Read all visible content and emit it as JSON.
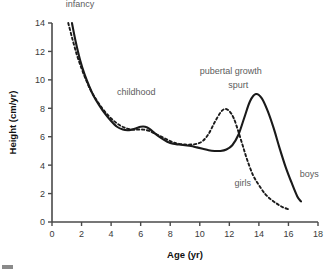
{
  "chart_data": {
    "type": "line",
    "title": "",
    "xlabel": "Age (yr)",
    "ylabel": "Height (cm/yr)",
    "xlim": [
      0,
      18
    ],
    "ylim": [
      0,
      14
    ],
    "xticks": [
      0,
      2,
      4,
      6,
      8,
      10,
      12,
      14,
      16,
      18
    ],
    "yticks": [
      0,
      2,
      4,
      6,
      8,
      10,
      12,
      14
    ],
    "grid": false,
    "legend": "inline-annotations",
    "series": [
      {
        "name": "boys",
        "style": "solid",
        "color": "#1a1a1a",
        "x": [
          1.35,
          1.6,
          1.9,
          2.2,
          2.5,
          2.8,
          3.2,
          3.6,
          4.0,
          4.4,
          4.8,
          5.1,
          5.4,
          5.7,
          6.0,
          6.3,
          6.6,
          7.0,
          7.4,
          7.8,
          8.2,
          8.6,
          9.0,
          9.4,
          9.8,
          10.2,
          10.6,
          11.0,
          11.4,
          11.8,
          12.2,
          12.6,
          13.0,
          13.4,
          13.8,
          14.2,
          14.6,
          15.0,
          15.4,
          15.8,
          16.2,
          16.6,
          16.85
        ],
        "y": [
          14.0,
          12.7,
          11.4,
          10.4,
          9.6,
          8.9,
          8.2,
          7.6,
          7.1,
          6.7,
          6.5,
          6.45,
          6.5,
          6.6,
          6.7,
          6.7,
          6.55,
          6.2,
          5.9,
          5.65,
          5.5,
          5.45,
          5.4,
          5.35,
          5.25,
          5.15,
          5.05,
          5.0,
          5.0,
          5.1,
          5.4,
          6.1,
          7.3,
          8.5,
          9.0,
          8.7,
          7.8,
          6.6,
          5.2,
          3.9,
          2.8,
          1.8,
          1.45
        ]
      },
      {
        "name": "girls",
        "style": "dashed",
        "color": "#1a1a1a",
        "x": [
          1.1,
          1.4,
          1.7,
          2.0,
          2.3,
          2.6,
          3.0,
          3.4,
          3.8,
          4.2,
          4.6,
          5.0,
          5.4,
          5.8,
          6.2,
          6.6,
          7.0,
          7.4,
          7.8,
          8.2,
          8.6,
          9.0,
          9.4,
          9.8,
          10.2,
          10.6,
          11.0,
          11.4,
          11.7,
          12.0,
          12.3,
          12.6,
          12.9,
          13.2,
          13.6,
          14.0,
          14.4,
          14.8,
          15.2,
          15.6,
          16.0
        ],
        "y": [
          14.0,
          12.8,
          11.7,
          10.8,
          10.0,
          9.3,
          8.6,
          8.0,
          7.5,
          7.1,
          6.8,
          6.6,
          6.5,
          6.5,
          6.5,
          6.4,
          6.2,
          6.0,
          5.8,
          5.6,
          5.5,
          5.45,
          5.45,
          5.5,
          5.7,
          6.2,
          7.0,
          7.7,
          7.95,
          7.8,
          7.3,
          6.4,
          5.4,
          4.4,
          3.3,
          2.6,
          2.0,
          1.6,
          1.3,
          1.05,
          0.9
        ]
      }
    ],
    "annotations": [
      {
        "text": "infancy",
        "x": 1.9,
        "y": 15.1
      },
      {
        "text": "childhood",
        "x": 5.7,
        "y": 8.9
      },
      {
        "text": "pubertal growth",
        "x": 12.1,
        "y": 10.4
      },
      {
        "text": "spurt",
        "x": 12.6,
        "y": 9.45
      },
      {
        "text": "girls",
        "x": 12.9,
        "y": 2.55
      },
      {
        "text": "boys",
        "x": 17.4,
        "y": 3.15
      }
    ]
  }
}
